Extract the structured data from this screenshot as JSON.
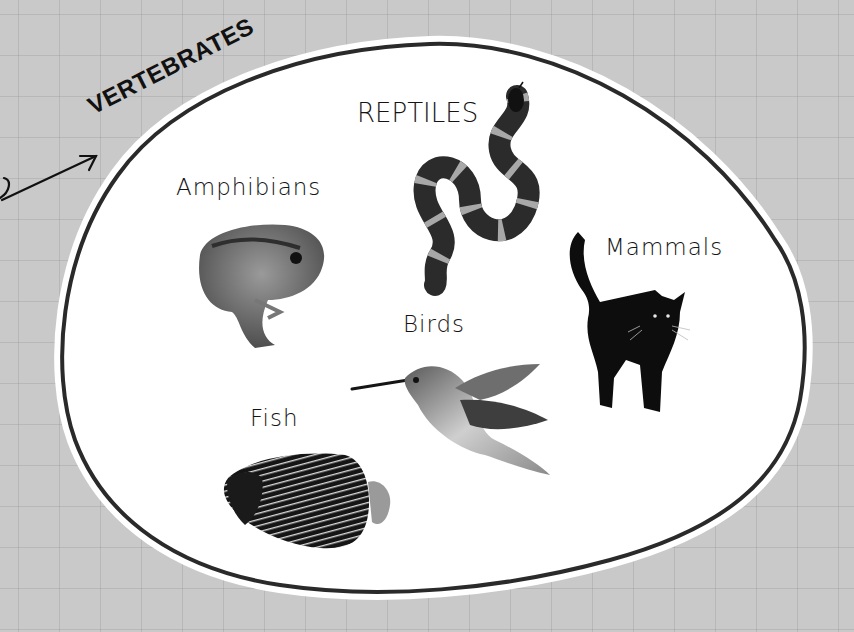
{
  "diagram": {
    "title": "VERTEBRATES",
    "background_color": "#c9c9c9",
    "region_fill": "#ffffff",
    "region_outline": "#2a2a2a",
    "groups": [
      {
        "label": "Amphibians",
        "icon": "frog-icon"
      },
      {
        "label": "REPTILES",
        "icon": "snake-icon"
      },
      {
        "label": "Mammals",
        "icon": "cat-icon"
      },
      {
        "label": "Birds",
        "icon": "hummingbird-icon"
      },
      {
        "label": "Fish",
        "icon": "angelfish-icon"
      }
    ]
  }
}
